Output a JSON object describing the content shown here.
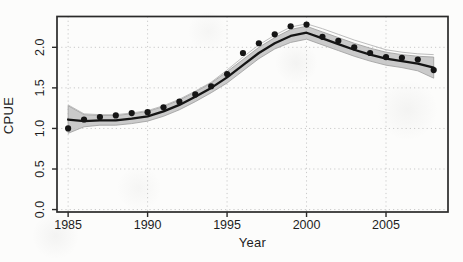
{
  "figure": {
    "background": "#fcfcfb"
  },
  "chart_data": {
    "type": "line",
    "title": "",
    "xlabel": "Year",
    "ylabel": "CPUE",
    "x_ticks": [
      1985,
      1990,
      1995,
      2000,
      2005
    ],
    "x_tick_labels": [
      "1985",
      "1990",
      "1995",
      "2000",
      "2005"
    ],
    "y_ticks": [
      0.0,
      0.5,
      1.0,
      1.5,
      2.0
    ],
    "y_tick_labels": [
      "0.0",
      "0.5",
      "1.0",
      "1.5",
      "2.0"
    ],
    "xlim": [
      1984.3,
      2008.9
    ],
    "ylim": [
      -0.03,
      2.38
    ],
    "grid": "dotted",
    "legend": "none",
    "x": [
      1985,
      1986,
      1987,
      1988,
      1989,
      1990,
      1991,
      1992,
      1993,
      1994,
      1995,
      1996,
      1997,
      1998,
      1999,
      2000,
      2001,
      2002,
      2003,
      2004,
      2005,
      2006,
      2007,
      2008
    ],
    "series": [
      {
        "name": "observed-cpue",
        "style": "points",
        "values": [
          1.0,
          1.11,
          1.14,
          1.16,
          1.19,
          1.2,
          1.26,
          1.33,
          1.42,
          1.52,
          1.67,
          1.93,
          2.05,
          2.16,
          2.26,
          2.28,
          2.13,
          2.08,
          2.0,
          1.93,
          1.88,
          1.87,
          1.85,
          1.72
        ]
      },
      {
        "name": "smoothed-cpue",
        "style": "line",
        "values": [
          1.11,
          1.09,
          1.1,
          1.1,
          1.12,
          1.15,
          1.21,
          1.29,
          1.39,
          1.5,
          1.63,
          1.78,
          1.93,
          2.05,
          2.14,
          2.18,
          2.11,
          2.04,
          1.97,
          1.91,
          1.86,
          1.83,
          1.8,
          1.75
        ]
      },
      {
        "name": "confidence-band",
        "style": "band",
        "upper": [
          1.28,
          1.17,
          1.16,
          1.16,
          1.18,
          1.21,
          1.27,
          1.35,
          1.45,
          1.56,
          1.7,
          1.85,
          2.0,
          2.12,
          2.22,
          2.26,
          2.19,
          2.12,
          2.05,
          1.99,
          1.94,
          1.91,
          1.89,
          1.88
        ],
        "lower": [
          0.94,
          1.02,
          1.04,
          1.04,
          1.06,
          1.09,
          1.15,
          1.23,
          1.33,
          1.44,
          1.56,
          1.71,
          1.86,
          1.98,
          2.06,
          2.1,
          2.03,
          1.96,
          1.89,
          1.83,
          1.78,
          1.75,
          1.71,
          1.62
        ]
      },
      {
        "name": "bootstrap-envelope",
        "style": "thin-line",
        "values": [
          1.29,
          1.18,
          1.17,
          1.17,
          1.19,
          1.22,
          1.28,
          1.36,
          1.46,
          1.57,
          1.72,
          1.88,
          2.03,
          2.15,
          2.25,
          2.29,
          2.23,
          2.16,
          2.09,
          2.03,
          1.97,
          1.94,
          1.92,
          1.91
        ]
      }
    ],
    "colors": {
      "point": "#151515",
      "line": "#151515",
      "band_fill": "#c1c1c1",
      "band_edge": "#9c9c9c",
      "envelope": "#b5b5b5",
      "grid": "#c9c9c9",
      "axis": "#2a2a2a",
      "text": "#1e1e1e"
    }
  }
}
